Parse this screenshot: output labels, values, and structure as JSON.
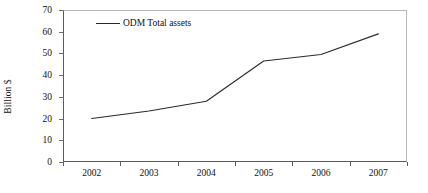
{
  "chart_data": {
    "type": "line",
    "title": "",
    "xlabel": "",
    "ylabel": "Billion $",
    "categories": [
      "2002",
      "2003",
      "2004",
      "2005",
      "2006",
      "2007"
    ],
    "series": [
      {
        "name": "ODM Total assets",
        "values": [
          20,
          23.5,
          28,
          46.5,
          49.5,
          59
        ],
        "color": "#2a2a2a"
      }
    ],
    "ylim": [
      0,
      70
    ],
    "y_ticks": [
      0,
      10,
      20,
      30,
      40,
      50,
      60,
      70
    ],
    "y_tick_labels": [
      "0",
      "10",
      "20",
      "30",
      "40",
      "50",
      "60",
      "70"
    ],
    "x_tick_labels": [
      "2002",
      "2003",
      "2004",
      "2005",
      "2006",
      "2007"
    ],
    "grid": false,
    "legend": {
      "position": "top-left-inside",
      "entries": [
        {
          "label": "ODM Total assets",
          "marker": "line",
          "color": "#2a2a2a"
        }
      ]
    },
    "axis_color": "#5d5d5d",
    "frame_color": "#b9b9b9",
    "background": "#ffffff"
  }
}
